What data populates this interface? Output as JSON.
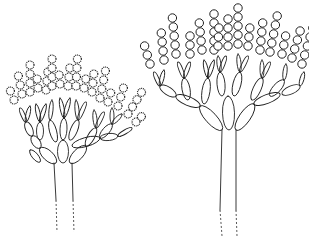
{
  "figure": {
    "panels": [
      {
        "id": "left",
        "description": "conidiophore with echinulate (spiny) conidia chains"
      },
      {
        "id": "right",
        "description": "conidiophore with smooth conidia chains"
      }
    ],
    "caption_visible": "partially cut off",
    "caption_text": ""
  },
  "colors": {
    "line": "#222222",
    "background": "#ffffff"
  }
}
